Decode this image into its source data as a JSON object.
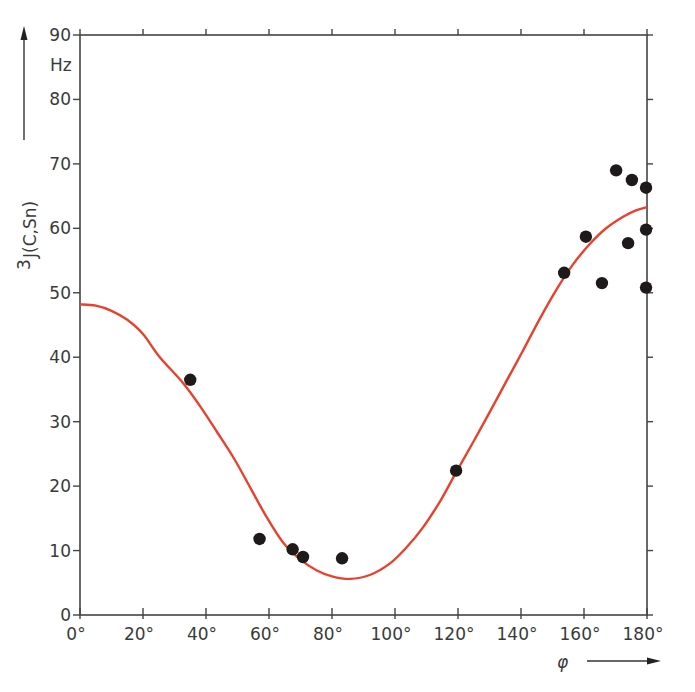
{
  "chart_data": {
    "type": "scatter",
    "title": "",
    "xlabel": "φ",
    "ylabel": "³J(C,Sn)",
    "yunit": "Hz",
    "xlim": [
      0,
      180
    ],
    "ylim": [
      0,
      90
    ],
    "grid": false,
    "legend": null,
    "x_ticks": [
      0,
      20,
      40,
      60,
      80,
      100,
      120,
      140,
      160,
      180
    ],
    "x_tick_labels": [
      "0°",
      "20°",
      "40°",
      "60°",
      "80°",
      "100°",
      "120°",
      "140°",
      "160°",
      "180°"
    ],
    "y_ticks": [
      0,
      10,
      20,
      30,
      40,
      50,
      60,
      70,
      80,
      90
    ],
    "y_tick_labels": [
      "0",
      "10",
      "20",
      "30",
      "40",
      "50",
      "60",
      "70",
      "80",
      "90"
    ],
    "series": [
      {
        "name": "measured",
        "kind": "scatter",
        "color": "#1e1a1a",
        "points": [
          [
            35,
            36.5
          ],
          [
            57,
            11.8
          ],
          [
            67.5,
            10.2
          ],
          [
            70.8,
            9.0
          ],
          [
            83.2,
            8.8
          ],
          [
            119.4,
            22.4
          ],
          [
            153.7,
            53.1
          ],
          [
            160.6,
            58.7
          ],
          [
            165.7,
            51.5
          ],
          [
            170.2,
            69.0
          ],
          [
            174.0,
            57.7
          ],
          [
            175.2,
            67.5
          ],
          [
            179.7,
            66.3
          ],
          [
            179.7,
            59.8
          ],
          [
            179.7,
            50.8
          ]
        ]
      },
      {
        "name": "Karplus fit",
        "kind": "line",
        "color": "#e8412e",
        "points": [
          [
            0,
            48.2
          ],
          [
            5,
            48.0
          ],
          [
            10,
            47.2
          ],
          [
            15,
            45.8
          ],
          [
            20,
            43.6
          ],
          [
            25,
            40.2
          ],
          [
            32.7,
            36.0
          ],
          [
            38,
            32.5
          ],
          [
            43.5,
            28.4
          ],
          [
            49,
            24.2
          ],
          [
            54,
            19.8
          ],
          [
            59,
            15.4
          ],
          [
            64.4,
            11.3
          ],
          [
            70,
            8.6
          ],
          [
            75.2,
            6.9
          ],
          [
            80,
            6.0
          ],
          [
            85.7,
            5.6
          ],
          [
            92,
            6.2
          ],
          [
            98.4,
            8.0
          ],
          [
            103.5,
            10.4
          ],
          [
            108.9,
            13.6
          ],
          [
            114.5,
            17.8
          ],
          [
            119.7,
            22.4
          ],
          [
            125,
            27.0
          ],
          [
            130.2,
            31.6
          ],
          [
            135.5,
            36.4
          ],
          [
            140.6,
            41.0
          ],
          [
            146,
            46.0
          ],
          [
            151.4,
            50.6
          ],
          [
            156.5,
            54.4
          ],
          [
            161.9,
            57.6
          ],
          [
            167,
            60.0
          ],
          [
            172.4,
            61.8
          ],
          [
            176.5,
            62.8
          ],
          [
            180,
            63.3
          ]
        ]
      }
    ]
  },
  "labels": {
    "y_unit": "Hz",
    "y_axis_label_prefix": "3",
    "y_axis_label_main": "J(C,Sn)",
    "x_axis_label": "φ"
  }
}
